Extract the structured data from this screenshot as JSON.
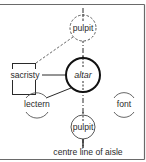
{
  "diagram": {
    "colors": {
      "line": "#2a2a2a",
      "dashed": "#555555",
      "frame": "#6a6a6a",
      "background": "#ffffff"
    },
    "nodes": {
      "pulpit_upper": {
        "label": "pulpit",
        "style": "dashed-circle"
      },
      "sacristy": {
        "label": "sacristy",
        "style": "box"
      },
      "altar": {
        "label": "altar",
        "style": "bold-circle"
      },
      "lectern": {
        "label": "lectern",
        "style": "open-arc-circle"
      },
      "font": {
        "label": "font",
        "style": "open-arc-circle"
      },
      "pulpit_lower": {
        "label": "pulpit",
        "style": "thin-circle"
      }
    },
    "edges": [
      {
        "from": "sacristy",
        "to": "pulpit_upper",
        "style": "dashed"
      },
      {
        "from": "sacristy",
        "to": "altar",
        "style": "solid"
      },
      {
        "from": "altar",
        "to": "lectern",
        "style": "solid"
      }
    ],
    "axis_label": "centre line of aisle"
  }
}
